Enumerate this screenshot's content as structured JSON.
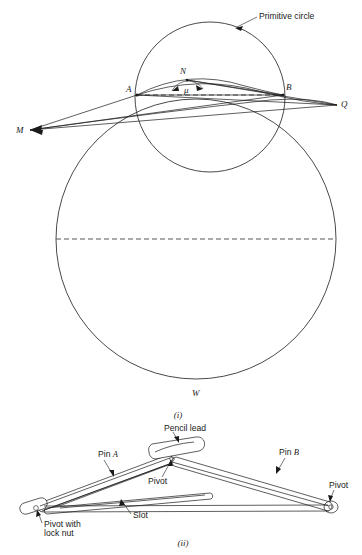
{
  "figure": {
    "background_color": "#ffffff",
    "ink_color": "#1a1a1a",
    "dash_color": "#555555"
  },
  "panel_i": {
    "caption": "(i)",
    "labels": {
      "primitive_circle": "Primitive circle",
      "point_a": "A",
      "point_b": "B",
      "point_n": "N",
      "point_m": "M",
      "point_q": "Q",
      "point_w": "W",
      "angle_mu": "μ"
    },
    "geometry": {
      "large_circle": {
        "cx": 196,
        "cy": 239,
        "r": 140
      },
      "small_circle": {
        "cx": 210,
        "cy": 97,
        "r": 75
      },
      "dashed_diameter": {
        "x1": 56,
        "y1": 239,
        "x2": 336,
        "y2": 239
      },
      "chord_ab": {
        "x1": 137,
        "y1": 95,
        "x2": 283,
        "y2": 95
      },
      "point_a": {
        "x": 137,
        "y": 95
      },
      "point_b": {
        "x": 283,
        "y": 95
      },
      "point_n": {
        "x": 187,
        "y": 80
      },
      "point_m": {
        "x": 30,
        "y": 130
      },
      "point_q": {
        "x": 337,
        "y": 105
      }
    }
  },
  "panel_ii": {
    "caption": "(ii)",
    "labels": {
      "pin_a_prefix": "Pin ",
      "pin_a_letter": "A",
      "pin_b_prefix": "Pin ",
      "pin_b_letter": "B",
      "pencil_lead": "Pencil lead",
      "pivot_center": "Pivot",
      "pivot_right": "Pivot",
      "pivot_lock_line1": "Pivot with",
      "pivot_lock_line2": "lock nut",
      "slot": "Slot"
    },
    "geometry": {
      "left_pivot": {
        "x": 36,
        "y": 508
      },
      "center_pivot": {
        "x": 172,
        "y": 461
      },
      "right_pivot": {
        "x": 332,
        "y": 508
      }
    }
  }
}
